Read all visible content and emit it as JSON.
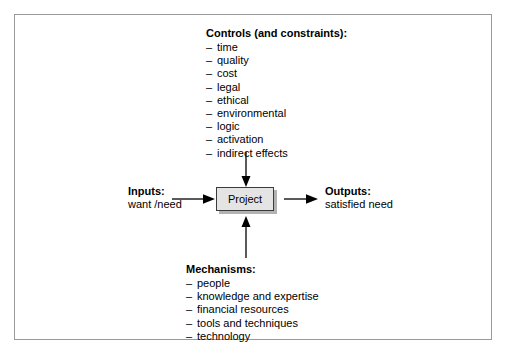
{
  "diagram": {
    "title_present": false,
    "frame": {
      "border_color": "#9a9a9a"
    },
    "controls": {
      "heading": "Controls (and constraints):",
      "bullet": "–",
      "items": [
        "time",
        "quality",
        "cost",
        "legal",
        "ethical",
        "environmental",
        "logic",
        "activation",
        "indirect effects"
      ]
    },
    "mechanisms": {
      "heading": "Mechanisms:",
      "bullet": "–",
      "items": [
        "people",
        "knowledge and expertise",
        "financial resources",
        "tools and techniques",
        "technology"
      ]
    },
    "inputs": {
      "heading": "Inputs:",
      "value": "want /need"
    },
    "outputs": {
      "heading": "Outputs:",
      "value": "satisfied need"
    },
    "process": {
      "label": "Project",
      "fill_color": "#e4e4e4",
      "border_color": "#3b3b3b",
      "shadow_color": "#b3b3b3"
    },
    "arrows": {
      "color": "#000000",
      "input_arrow": "inputs-to-project",
      "output_arrow": "project-to-outputs",
      "control_arrow": "controls-to-project",
      "mechanism_arrow": "mechanisms-to-project"
    }
  }
}
